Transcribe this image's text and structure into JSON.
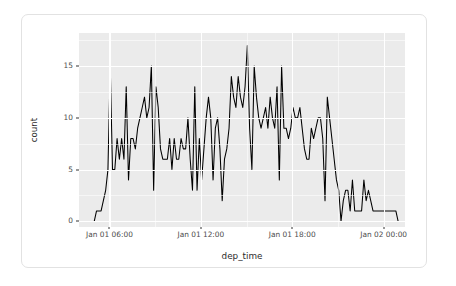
{
  "figure": {
    "background_color": "#ffffff",
    "card_border_color": "#e2e2e2",
    "panel_color": "#ebebeb",
    "grid_color": "#ffffff",
    "line_color": "#000000"
  },
  "chart_data": {
    "type": "line",
    "title": "",
    "subtitle": "",
    "xlabel": "dep_time",
    "ylabel": "count",
    "grid": true,
    "legend": null,
    "legend_position": "none",
    "x_tick_labels": [
      "Jan 01 06:00",
      "Jan 01 12:00",
      "Jan 01 18:00",
      "Jan 02 00:00"
    ],
    "x_tick_values": [
      6,
      12,
      18,
      24
    ],
    "xlim": [
      4.0,
      25.4
    ],
    "y_tick_labels": [
      "0",
      "5",
      "10",
      "15"
    ],
    "y_tick_values": [
      0,
      5,
      10,
      15
    ],
    "ylim": [
      -0.55,
      18.2
    ],
    "y_minor_ticks": [
      2.5,
      7.5,
      12.5,
      17.5
    ],
    "x_minor_ticks": [
      9,
      15,
      21
    ],
    "series": [
      {
        "name": "count",
        "color": "#000000",
        "x": [
          5.0,
          5.15,
          5.3,
          5.45,
          5.6,
          5.75,
          5.9,
          6.05,
          6.2,
          6.35,
          6.5,
          6.65,
          6.8,
          6.95,
          7.1,
          7.25,
          7.4,
          7.55,
          7.7,
          7.85,
          8.0,
          8.15,
          8.3,
          8.45,
          8.6,
          8.75,
          8.9,
          9.05,
          9.2,
          9.35,
          9.5,
          9.65,
          9.8,
          9.95,
          10.1,
          10.25,
          10.4,
          10.55,
          10.7,
          10.85,
          11.0,
          11.15,
          11.3,
          11.45,
          11.6,
          11.75,
          11.9,
          12.05,
          12.2,
          12.35,
          12.5,
          12.65,
          12.8,
          12.95,
          13.1,
          13.25,
          13.4,
          13.55,
          13.7,
          13.85,
          14.0,
          14.15,
          14.3,
          14.45,
          14.6,
          14.75,
          14.9,
          15.05,
          15.2,
          15.35,
          15.5,
          15.65,
          15.8,
          15.95,
          16.1,
          16.25,
          16.4,
          16.55,
          16.7,
          16.85,
          17.0,
          17.15,
          17.3,
          17.45,
          17.6,
          17.75,
          17.9,
          18.05,
          18.2,
          18.35,
          18.5,
          18.65,
          18.8,
          18.95,
          19.1,
          19.25,
          19.4,
          19.55,
          19.7,
          19.85,
          20.0,
          20.15,
          20.3,
          20.45,
          20.6,
          20.75,
          20.9,
          21.05,
          21.2,
          21.35,
          21.5,
          21.65,
          21.8,
          21.95,
          22.1,
          22.25,
          22.4,
          22.55,
          22.7,
          22.85,
          23.0,
          23.15,
          23.3,
          23.45,
          23.6,
          23.75,
          23.9,
          24.05,
          24.2,
          24.35,
          24.5,
          24.65,
          24.8,
          24.95
        ],
        "values": [
          0,
          1,
          1,
          1,
          2,
          3,
          5,
          15,
          5,
          5,
          8,
          6,
          8,
          6,
          13,
          4,
          8,
          8,
          7,
          9,
          10,
          11,
          12,
          10,
          11,
          15,
          3,
          13,
          11,
          7,
          6,
          6,
          6,
          8,
          5,
          8,
          6,
          6,
          8,
          7,
          7,
          10,
          6,
          3,
          13,
          3,
          8,
          4,
          7,
          10,
          12,
          10,
          4,
          9,
          10,
          7,
          2,
          6,
          7,
          9,
          14,
          12,
          11,
          14,
          12,
          11,
          13,
          17,
          9,
          5,
          15,
          12,
          10,
          9,
          10,
          11,
          9,
          12,
          10,
          9,
          13,
          4,
          15,
          9,
          9,
          8,
          9,
          11,
          10,
          10,
          11,
          9,
          7,
          6,
          6,
          9,
          8,
          9,
          10,
          10,
          8,
          2,
          12,
          10,
          8,
          6,
          4,
          3,
          0,
          2,
          3,
          3,
          1,
          4,
          1,
          1,
          1,
          1,
          4,
          2,
          3,
          2,
          1,
          1,
          1,
          1,
          1,
          1,
          1,
          1,
          1,
          1,
          1,
          0
        ]
      }
    ]
  }
}
